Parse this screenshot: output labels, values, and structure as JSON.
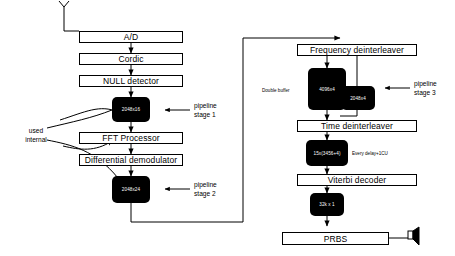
{
  "diagram": {
    "left_chain": {
      "antenna_label": "antenna-icon",
      "blocks": [
        {
          "id": "adc",
          "label": "A/D"
        },
        {
          "id": "cordic",
          "label": "Cordic"
        },
        {
          "id": "null_detector",
          "label": "NULL detector"
        },
        {
          "id": "fft",
          "label": "FFT Processor"
        },
        {
          "id": "diff_demod",
          "label": "Differential demodulator"
        }
      ],
      "memories": [
        {
          "id": "mem_2048x16",
          "label": "2048x16"
        },
        {
          "id": "mem_2048x24",
          "label": "2048x24"
        }
      ],
      "side_note": "used\ninternal",
      "side_note_line1": "used",
      "side_note_line2": "internal"
    },
    "right_chain": {
      "blocks": [
        {
          "id": "freq_deint",
          "label": "Frequency deinterleaver"
        },
        {
          "id": "time_deint",
          "label": "Time deinterleaver"
        },
        {
          "id": "viterbi",
          "label": "Viterbi decoder"
        },
        {
          "id": "prbs",
          "label": "PRBS"
        }
      ],
      "memories": [
        {
          "id": "mem_4096x4",
          "label": "4096x4"
        },
        {
          "id": "mem_2048x4",
          "label": "2048x4"
        },
        {
          "id": "mem_delay",
          "label": "15x(3456+4)"
        },
        {
          "id": "mem_32kx1",
          "label": "32k x 1"
        }
      ],
      "annotations": [
        {
          "id": "double_buffer",
          "label": "Double buffer"
        },
        {
          "id": "every_delay",
          "label": "Every delay+1CU"
        }
      ],
      "output_icon": "speaker-icon"
    },
    "pipeline_stages": [
      {
        "id": "stage1",
        "line1": "pipeline",
        "line2": "stage 1"
      },
      {
        "id": "stage2",
        "line1": "pipeline",
        "line2": "stage 2"
      },
      {
        "id": "stage3",
        "line1": "pipeline",
        "line2": "stage 3"
      }
    ],
    "colors": {
      "line": "#000000",
      "memory_fill": "#000000",
      "memory_text": "#ffffff",
      "block_fill": "#ffffff",
      "background": "#ffffff"
    }
  }
}
